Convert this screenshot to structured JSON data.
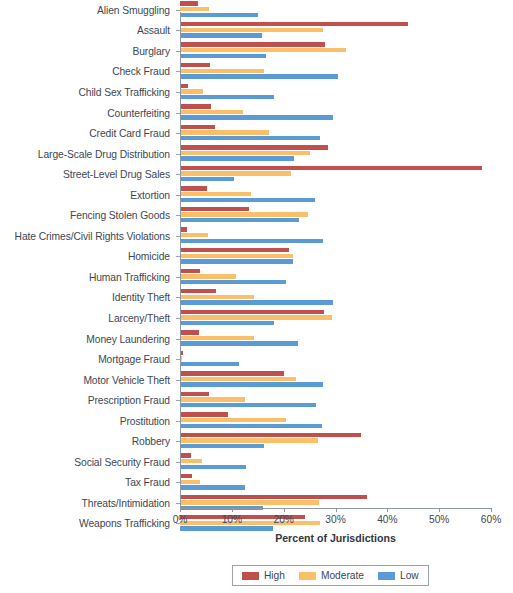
{
  "chart_data": {
    "type": "bar",
    "orientation": "horizontal",
    "title": "",
    "xlabel": "Percent of Jurisdictions",
    "ylabel": "",
    "xlim": [
      0,
      60
    ],
    "xtick_labels": [
      "0%",
      "10%",
      "20%",
      "30%",
      "40%",
      "50%",
      "60%"
    ],
    "xticks": [
      0,
      10,
      20,
      30,
      40,
      50,
      60
    ],
    "grid": false,
    "legend_position": "bottom-center",
    "colors": {
      "High": "#C0504D",
      "Moderate": "#FABF69",
      "Low": "#5B9BD5"
    },
    "legend": [
      "High",
      "Moderate",
      "Low"
    ],
    "categories": [
      "Alien Smuggling",
      "Assault",
      "Burglary",
      "Check Fraud",
      "Child Sex Trafficking",
      "Counterfeiting",
      "Credit Card Fraud",
      "Large-Scale Drug Distribution",
      "Street-Level Drug Sales",
      "Extortion",
      "Fencing Stolen Goods",
      "Hate Crimes/Civil Rights Violations",
      "Homicide",
      "Human Trafficking",
      "Identity Theft",
      "Larceny/Theft",
      "Money Laundering",
      "Mortgage Fraud",
      "Motor Vehicle Theft",
      "Prescription Fraud",
      "Prostitution",
      "Robbery",
      "Social Security Fraud",
      "Tax Fraud",
      "Threats/Intimidation",
      "Weapons Trafficking"
    ],
    "series": [
      {
        "name": "High",
        "color": "#C0504D",
        "values": [
          3.5,
          44.0,
          28.0,
          5.8,
          1.5,
          6.0,
          6.8,
          28.5,
          58.3,
          5.2,
          13.3,
          1.4,
          21.0,
          3.8,
          7.0,
          27.8,
          3.6,
          0.6,
          20.1,
          5.6,
          9.2,
          35.0,
          2.1,
          2.3,
          36.1,
          24.1
        ]
      },
      {
        "name": "Moderate",
        "color": "#FABF69",
        "values": [
          5.6,
          27.6,
          32.0,
          16.2,
          4.4,
          12.2,
          17.2,
          25.0,
          21.4,
          13.7,
          24.7,
          5.4,
          21.8,
          10.8,
          14.2,
          29.3,
          14.2,
          0.3,
          22.4,
          12.6,
          20.4,
          26.6,
          4.2,
          3.9,
          26.8,
          27.0
        ]
      },
      {
        "name": "Low",
        "color": "#5B9BD5",
        "values": [
          15.0,
          15.8,
          16.6,
          30.5,
          18.1,
          29.5,
          27.0,
          22.0,
          10.4,
          26.0,
          23.0,
          27.6,
          21.8,
          20.4,
          29.5,
          18.1,
          22.7,
          11.4,
          27.6,
          26.2,
          27.3,
          16.2,
          12.7,
          12.6,
          16.0,
          18.0
        ]
      }
    ]
  }
}
